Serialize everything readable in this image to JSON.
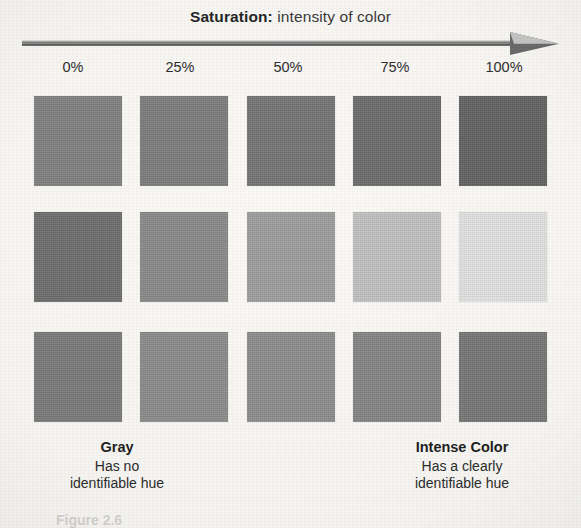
{
  "figure": {
    "title_strong": "Saturation:",
    "title_rest": " intensity of color",
    "cut_off_caption": "Figure 2.6"
  },
  "axis": {
    "arrow_name": "right-arrow",
    "arrow_color": "#6f6f6f",
    "arrowhead_light": "#c9c9c9",
    "ticks": [
      {
        "label": "0%",
        "x": 73
      },
      {
        "label": "25%",
        "x": 180
      },
      {
        "label": "50%",
        "x": 288
      },
      {
        "label": "75%",
        "x": 395
      },
      {
        "label": "100%",
        "x": 504
      }
    ]
  },
  "endpoints": {
    "left": {
      "title": "Gray",
      "line1": "Has no",
      "line2": "identifiable hue"
    },
    "right": {
      "title": "Intense Color",
      "line1": "Has a clearly",
      "line2": "identifiable hue"
    }
  },
  "chart_data": {
    "type": "heatmap",
    "title": "Saturation: intensity of color",
    "xlabel": "Saturation",
    "ylabel": "",
    "categories": [
      "0%",
      "25%",
      "50%",
      "75%",
      "100%"
    ],
    "row_names": [
      "row-1",
      "row-2",
      "row-3"
    ],
    "grid": false,
    "legend": "none",
    "note": "Grayscale scan of a color-saturation chart: 3 rows x 5 columns of square swatches increasing in saturation left to right.",
    "columns_x": [
      34,
      140,
      247,
      353,
      459
    ],
    "rows_y": [
      96,
      212,
      332
    ],
    "swatch_width": 88,
    "swatch_height": 90,
    "series": [
      {
        "name": "row-1",
        "values": [
          "#808080",
          "#7d7d7d",
          "#757575",
          "#6c6c6c",
          "#626262"
        ]
      },
      {
        "name": "row-2",
        "values": [
          "#6e6e6e",
          "#8a8a8a",
          "#9e9e9e",
          "#c2c2c2",
          "#e3e3e3"
        ]
      },
      {
        "name": "row-3",
        "values": [
          "#7a7a7a",
          "#8b8b8b",
          "#8d8d8d",
          "#848484",
          "#767676"
        ]
      }
    ]
  }
}
